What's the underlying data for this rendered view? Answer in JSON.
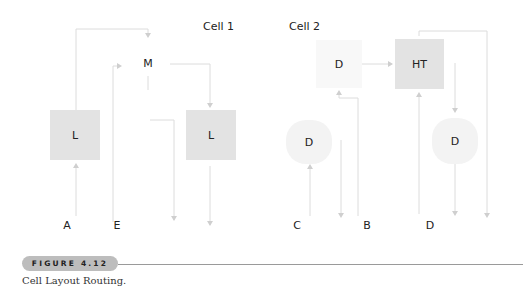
{
  "figure": {
    "cells": [
      {
        "title": "Cell 1"
      },
      {
        "title": "Cell 2"
      }
    ],
    "blocks": {
      "cell1_L_left": "L",
      "cell1_M": "M",
      "cell1_L_right": "L",
      "cell2_D_top": "D",
      "cell2_HT": "HT",
      "cell2_D_left": "D",
      "cell2_D_right": "D"
    },
    "pins": [
      "A",
      "E",
      "C",
      "B",
      "D"
    ],
    "badge": "FIGURE 4.12",
    "caption": "Cell Layout Routing."
  },
  "colors": {
    "block_dark": "#e3e3e3",
    "block_light": "#f3f3f3",
    "wire": "#dcdcdc",
    "badge": "#bdbdbd",
    "rule": "#9a9a9a"
  }
}
